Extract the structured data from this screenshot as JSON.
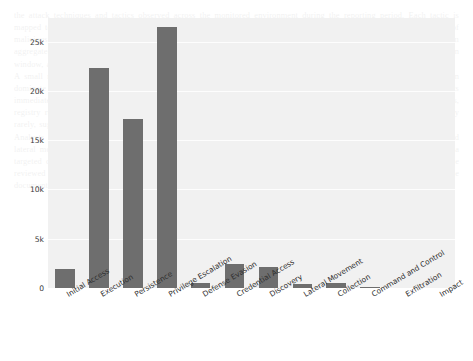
{
  "chart_data": {
    "type": "bar",
    "title": "",
    "subtitle": "",
    "xlabel": "",
    "ylabel": "",
    "categories": [
      "Initial Access",
      "Execution",
      "Persistence",
      "Privilege Escalation",
      "Defense Evasion",
      "Credential Access",
      "Discovery",
      "Lateral Movement",
      "Collection",
      "Command and Control",
      "Exfiltration",
      "Impact"
    ],
    "values": [
      1900,
      22300,
      17200,
      26500,
      500,
      2400,
      2100,
      400,
      500,
      120,
      0,
      0
    ],
    "ylim": [
      0,
      27400
    ],
    "yticks": [
      0,
      5000,
      10000,
      15000,
      20000,
      25000
    ],
    "ytick_labels": [
      "0",
      "5k",
      "10k",
      "15k",
      "20k",
      "25k"
    ],
    "grid": true,
    "grid_axis": "y",
    "legend": "none",
    "bar_color": "#6e6e6e",
    "plot_background": "#f1f1f1",
    "figure_background": "#ffffff",
    "xtick_rotation": -31
  },
  "background_text": "the attack techniques and tactics observed across the monitored environment during the reporting period. Each tactic is mapped to the corresponding stage of the adversary lifecycle so that analysts can quickly identify where the majority of malicious activity is concentrated and prioritise mitigations accordingly. The distribution shown below is derived from aggregated telemetry collected from endpoint sensors, network probes and authentication logs over the full observation window, and it is normalised to remove duplicate alerts raised by overlapping detection rules.\nA small number of tactics account for the overwhelming majority of the detections. Privilege escalation and execution dominate the dataset, which is consistent with commodity malware families that attempt to obtain elevated rights immediately after an initial foothold is established. Persistence follows closely, reflecting the use of scheduled tasks, registry run keys and service installation to survive reboots. By contrast, exfiltration and impact techniques appear only rarely, suggesting that the majority of intrusions were interrupted before the adversary reached their final objective.\nAnalysts should treat the long tail of low frequency tactics with care. Although collection, command and control and lateral movement contribute only a small fraction of the total event volume, they are often the strongest indicators of a targeted operation rather than opportunistic commodity activity. Detection coverage for those tactics should therefore be reviewed in parallel with the high volume categories, and any gaps in sensor placement or log retention should be documented in the next assessment cycle."
}
